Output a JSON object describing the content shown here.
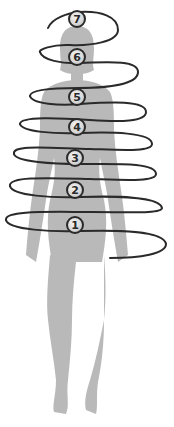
{
  "diagram": {
    "colors": {
      "silhouette": "#b9b9b9",
      "spiral": "#2a2a2a",
      "background": "#ffffff",
      "marker_fill": "#d6d6d6"
    },
    "markers": [
      {
        "label": "1",
        "x": 75,
        "y": 225
      },
      {
        "label": "2",
        "x": 75,
        "y": 190
      },
      {
        "label": "3",
        "x": 75,
        "y": 158
      },
      {
        "label": "4",
        "x": 77,
        "y": 127
      },
      {
        "label": "5",
        "x": 77,
        "y": 97
      },
      {
        "label": "6",
        "x": 77,
        "y": 57
      },
      {
        "label": "7",
        "x": 77,
        "y": 19
      }
    ]
  }
}
